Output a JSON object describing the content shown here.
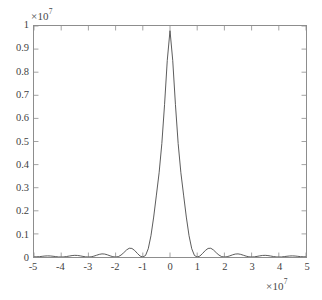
{
  "figure": {
    "background_color": "#ffffff",
    "axes_color": "#8d8d8d",
    "curve_color": "#4a4a4a",
    "text_color": "#3f3f3f"
  },
  "y_axis": {
    "exponent_prefix": "×",
    "exponent_base": "10",
    "exponent_power": "7",
    "tick_labels": [
      "1",
      "0.9",
      "0.8",
      "0.7",
      "0.6",
      "0.5",
      "0.4",
      "0.3",
      "0.2",
      "0.1",
      "0"
    ]
  },
  "x_axis": {
    "exponent_prefix": "×",
    "exponent_base": "10",
    "exponent_power": "7",
    "tick_labels": [
      "-5",
      "-4",
      "-3",
      "-2",
      "-1",
      "0",
      "1",
      "2",
      "3",
      "4",
      "5"
    ]
  },
  "chart_data": {
    "type": "line",
    "title": "",
    "xlabel": "",
    "ylabel": "",
    "xlim": [
      -5,
      5
    ],
    "ylim": [
      0,
      1
    ],
    "x_scale_exponent": 7,
    "y_scale_exponent": 7,
    "grid": false,
    "legend": null,
    "legend_position": "none",
    "xticks": [
      -5,
      -4,
      -3,
      -2,
      -1,
      0,
      1,
      2,
      3,
      4,
      5
    ],
    "yticks": [
      0,
      0.1,
      0.2,
      0.3,
      0.4,
      0.5,
      0.6,
      0.7,
      0.8,
      0.9,
      1
    ],
    "series": [
      {
        "name": "sinc-squared",
        "description": "Squared cardinal sine envelope: main lobe peak 0.98e7 at x=0, nulls at integer multiples of 1e7, side lobes decaying",
        "peak_value": 0.98,
        "nulls_x": [
          -5,
          -4,
          -3,
          -2,
          -1,
          1,
          2,
          3,
          4,
          5
        ],
        "sidelobe_peaks": [
          {
            "x": -4.5,
            "y": 0.005
          },
          {
            "x": -3.5,
            "y": 0.008
          },
          {
            "x": -2.5,
            "y": 0.016
          },
          {
            "x": -1.5,
            "y": 0.045
          },
          {
            "x": 1.5,
            "y": 0.045
          },
          {
            "x": 2.5,
            "y": 0.016
          },
          {
            "x": 3.5,
            "y": 0.008
          },
          {
            "x": 4.5,
            "y": 0.005
          }
        ],
        "x": [
          -5,
          -4.9,
          -4.8,
          -4.7,
          -4.6,
          -4.5,
          -4.4,
          -4.3,
          -4.2,
          -4.1,
          -4,
          -3.9,
          -3.8,
          -3.7,
          -3.6,
          -3.5,
          -3.4,
          -3.3,
          -3.2,
          -3.1,
          -3,
          -2.9,
          -2.8,
          -2.7,
          -2.6,
          -2.5,
          -2.4,
          -2.3,
          -2.2,
          -2.1,
          -2,
          -1.9,
          -1.8,
          -1.7,
          -1.6,
          -1.5,
          -1.4,
          -1.3,
          -1.2,
          -1.1,
          -1,
          -0.9,
          -0.8,
          -0.7,
          -0.6,
          -0.5,
          -0.4,
          -0.3,
          -0.2,
          -0.1,
          0,
          0.1,
          0.2,
          0.3,
          0.4,
          0.5,
          0.6,
          0.7,
          0.8,
          0.9,
          1,
          1.1,
          1.2,
          1.3,
          1.4,
          1.5,
          1.6,
          1.7,
          1.8,
          1.9,
          2,
          2.1,
          2.2,
          2.3,
          2.4,
          2.5,
          2.6,
          2.7,
          2.8,
          2.9,
          3,
          3.1,
          3.2,
          3.3,
          3.4,
          3.5,
          3.6,
          3.7,
          3.8,
          3.9,
          4,
          4.1,
          4.2,
          4.3,
          4.4,
          4.5,
          4.6,
          4.7,
          4.8,
          4.9,
          5
        ],
        "y": [
          0,
          0.0004,
          0.0015,
          0.0029,
          0.0042,
          0.0048,
          0.0044,
          0.0032,
          0.0017,
          0.0004,
          0,
          0.0005,
          0.0021,
          0.0042,
          0.0062,
          0.0072,
          0.0067,
          0.0049,
          0.0026,
          0.0007,
          0,
          0.0008,
          0.0036,
          0.0075,
          0.0114,
          0.0135,
          0.0127,
          0.0094,
          0.005,
          0.0013,
          0,
          0.0017,
          0.0083,
          0.0186,
          0.0302,
          0.0379,
          0.0371,
          0.0284,
          0.0156,
          0.0042,
          0,
          0.0064,
          0.0357,
          0.0921,
          0.1729,
          0.268,
          0.3646,
          0.491,
          0.6595,
          0.8512,
          0.98,
          0.8512,
          0.6595,
          0.491,
          0.3646,
          0.268,
          0.1729,
          0.0921,
          0.0357,
          0.0064,
          0,
          0.0042,
          0.0156,
          0.0284,
          0.0371,
          0.0379,
          0.0302,
          0.0186,
          0.0083,
          0.0017,
          0,
          0.0013,
          0.005,
          0.0094,
          0.0127,
          0.0135,
          0.0114,
          0.0075,
          0.0036,
          0.0008,
          0,
          0.0007,
          0.0026,
          0.0049,
          0.0067,
          0.0072,
          0.0062,
          0.0042,
          0.0021,
          0.0005,
          0,
          0.0004,
          0.0017,
          0.0032,
          0.0044,
          0.0048,
          0.0042,
          0.0029,
          0.0015,
          0.0004,
          0
        ]
      }
    ]
  }
}
